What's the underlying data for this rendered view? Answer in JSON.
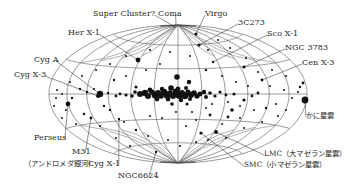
{
  "figure": {
    "type": "all-sky map (Aitoff projection, galactic coordinates)",
    "colors": {
      "grid": "#555555",
      "source": "#111111",
      "text": "#222222",
      "background": "#ffffff"
    }
  },
  "labels": [
    {
      "id": "super-cluster",
      "text": "Super Cluster?",
      "x": 93,
      "y": 10,
      "tx": 175,
      "ty": 27
    },
    {
      "id": "coma",
      "text": "Coma",
      "x": 158,
      "y": 10,
      "tx": 176,
      "ty": 25
    },
    {
      "id": "virgo",
      "text": "Virgo",
      "x": 205,
      "y": 10,
      "tx": 196,
      "ty": 34
    },
    {
      "id": "3c273",
      "text": "3C273",
      "x": 238,
      "y": 19,
      "tx": 199,
      "ty": 45
    },
    {
      "id": "her-x1",
      "text": "Her X-1",
      "x": 68,
      "y": 29,
      "tx": 138,
      "ty": 60
    },
    {
      "id": "sco-x1",
      "text": "Sco X-1",
      "x": 267,
      "y": 30,
      "tx": 213,
      "ty": 62
    },
    {
      "id": "ngc3783",
      "text": "NGC 3783",
      "x": 285,
      "y": 44,
      "tx": 244,
      "ty": 67
    },
    {
      "id": "cyg-a",
      "text": "Cyg A",
      "x": 34,
      "y": 56,
      "tx": 100,
      "ty": 94
    },
    {
      "id": "cen-x3",
      "text": "Cen X-3",
      "x": 302,
      "y": 59,
      "tx": 262,
      "ty": 80
    },
    {
      "id": "cyg-x3",
      "text": "Cyg X-3",
      "x": 14,
      "y": 71,
      "tx": 98,
      "ty": 96
    },
    {
      "id": "crab",
      "text": "かに星雲",
      "x": 306,
      "y": 112,
      "tx": 305,
      "ty": 100,
      "jp": true
    },
    {
      "id": "perseus",
      "text": "Perseus",
      "x": 34,
      "y": 134,
      "tx": 68,
      "ty": 104
    },
    {
      "id": "m31",
      "text": "M31",
      "x": 72,
      "y": 148,
      "tx": 91,
      "ty": 118
    },
    {
      "id": "lmc",
      "text": "LMC（大マゼラン星雲）",
      "x": 264,
      "y": 150,
      "tx": 216,
      "ty": 132,
      "jp": true
    },
    {
      "id": "andromeda",
      "text": "（アンドロメダ銀河）",
      "x": 24,
      "y": 160,
      "jp": true
    },
    {
      "id": "cyg-x1",
      "text": "Cyg X-1",
      "x": 88,
      "y": 160,
      "tx": 119,
      "ty": 119
    },
    {
      "id": "smc",
      "text": "SMC（小マゼラン星雲）",
      "x": 244,
      "y": 161,
      "tx": 201,
      "ty": 133,
      "jp": true
    },
    {
      "id": "ngc6624",
      "text": "NGC6624",
      "x": 118,
      "y": 172,
      "tx": 156,
      "ty": 152
    }
  ],
  "projection": {
    "cx": 178,
    "cy": 94,
    "a": 129,
    "b": 69,
    "meridian_step_deg": 30,
    "parallel_step_deg": 30
  },
  "sources": [
    [
      140,
      94,
      3
    ],
    [
      145,
      93,
      3.2
    ],
    [
      148,
      96,
      3
    ],
    [
      152,
      92,
      2.6
    ],
    [
      155,
      95,
      3.4
    ],
    [
      158,
      93,
      3
    ],
    [
      161,
      96,
      2.8
    ],
    [
      164,
      92,
      3.2
    ],
    [
      167,
      95,
      3.6
    ],
    [
      170,
      93,
      2.8
    ],
    [
      173,
      96,
      3
    ],
    [
      176,
      92,
      3.4
    ],
    [
      179,
      95,
      3.8
    ],
    [
      182,
      93,
      3
    ],
    [
      185,
      96,
      3.2
    ],
    [
      188,
      92,
      2.6
    ],
    [
      191,
      95,
      3
    ],
    [
      194,
      93,
      2.8
    ],
    [
      197,
      96,
      2.6
    ],
    [
      200,
      94,
      2.4
    ],
    [
      204,
      92,
      2.2
    ],
    [
      150,
      90,
      2.4
    ],
    [
      162,
      89,
      2.2
    ],
    [
      171,
      88,
      2.8
    ],
    [
      178,
      89,
      2.4
    ],
    [
      186,
      88,
      2
    ],
    [
      157,
      99,
      2.4
    ],
    [
      168,
      99,
      2.4
    ],
    [
      181,
      100,
      2.2
    ],
    [
      190,
      99,
      2
    ],
    [
      206,
      97,
      2
    ],
    [
      210,
      93,
      1.8
    ],
    [
      132,
      96,
      1.8
    ],
    [
      135,
      92,
      1.8
    ],
    [
      126,
      95,
      1.6
    ],
    [
      215,
      96,
      1.6
    ],
    [
      220,
      92,
      1.6
    ],
    [
      226,
      95,
      1.4
    ],
    [
      234,
      94,
      1.6
    ],
    [
      120,
      94,
      1.4
    ],
    [
      116,
      96,
      1.4
    ],
    [
      108,
      93,
      1.2
    ],
    [
      100,
      94,
      3.2
    ],
    [
      98,
      96,
      2
    ],
    [
      177,
      77,
      2.8
    ],
    [
      189,
      82,
      2.2
    ],
    [
      136,
      87,
      1.6
    ],
    [
      172,
      104,
      1.8
    ],
    [
      187,
      104,
      1.6
    ],
    [
      244,
      100,
      1.6
    ],
    [
      252,
      96,
      1.4
    ],
    [
      258,
      93,
      1.4
    ],
    [
      305,
      100,
      3.4
    ],
    [
      300,
      87,
      1.2
    ],
    [
      303,
      83,
      1.4
    ],
    [
      138,
      60,
      2.4
    ],
    [
      199,
      45,
      1.6
    ],
    [
      196,
      34,
      1.6
    ],
    [
      213,
      62,
      1.2
    ],
    [
      244,
      67,
      1.6
    ],
    [
      262,
      80,
      1.4
    ],
    [
      68,
      104,
      2.4
    ],
    [
      91,
      118,
      1.4
    ],
    [
      119,
      119,
      1.2
    ],
    [
      156,
      152,
      1.2
    ],
    [
      216,
      132,
      2
    ],
    [
      201,
      133,
      1.6
    ],
    [
      232,
      110,
      1.8
    ],
    [
      228,
      117,
      1.4
    ],
    [
      210,
      115,
      1.4
    ],
    [
      72,
      98,
      1.2
    ],
    [
      80,
      89,
      1.2
    ],
    [
      87,
      92,
      1.2
    ],
    [
      94,
      89,
      1
    ],
    [
      62,
      94,
      1
    ],
    [
      57,
      90,
      1
    ],
    [
      56,
      98,
      1
    ],
    [
      66,
      110,
      1
    ],
    [
      84,
      114,
      1.2
    ],
    [
      104,
      106,
      1.2
    ],
    [
      110,
      110,
      1.2
    ],
    [
      124,
      122,
      1
    ],
    [
      136,
      130,
      1.2
    ],
    [
      148,
      136,
      1
    ],
    [
      168,
      140,
      1
    ],
    [
      186,
      126,
      1
    ],
    [
      196,
      120,
      1
    ],
    [
      206,
      108,
      1
    ],
    [
      222,
      124,
      1
    ],
    [
      240,
      118,
      1
    ],
    [
      254,
      110,
      1
    ],
    [
      266,
      108,
      1.2
    ],
    [
      276,
      104,
      1
    ],
    [
      286,
      110,
      1
    ],
    [
      292,
      98,
      1
    ],
    [
      284,
      90,
      1
    ],
    [
      270,
      86,
      1
    ],
    [
      258,
      72,
      1
    ],
    [
      246,
      58,
      1
    ],
    [
      230,
      48,
      1
    ],
    [
      218,
      40,
      1
    ],
    [
      208,
      50,
      1
    ],
    [
      190,
      56,
      1
    ],
    [
      170,
      52,
      1
    ],
    [
      150,
      50,
      1
    ],
    [
      126,
      56,
      1
    ],
    [
      110,
      64,
      1
    ],
    [
      96,
      70,
      1
    ],
    [
      82,
      76,
      1
    ],
    [
      70,
      82,
      1
    ],
    [
      114,
      80,
      1.2
    ],
    [
      126,
      76,
      1
    ],
    [
      146,
      70,
      1
    ],
    [
      160,
      64,
      1
    ],
    [
      206,
      70,
      1.2
    ],
    [
      222,
      76,
      1
    ],
    [
      236,
      82,
      1
    ],
    [
      248,
      86,
      1
    ],
    [
      272,
      70,
      1
    ],
    [
      286,
      76,
      1
    ],
    [
      298,
      92,
      1
    ],
    [
      150,
      116,
      1
    ],
    [
      162,
      118,
      1
    ],
    [
      176,
      112,
      1
    ],
    [
      192,
      112,
      1
    ],
    [
      212,
      104,
      1
    ],
    [
      228,
      102,
      1
    ],
    [
      240,
      106,
      1
    ],
    [
      100,
      126,
      1
    ],
    [
      116,
      138,
      1
    ],
    [
      130,
      146,
      1
    ],
    [
      180,
      146,
      1
    ],
    [
      196,
      142,
      1
    ],
    [
      208,
      140,
      1
    ],
    [
      226,
      138,
      1
    ],
    [
      244,
      128,
      1
    ],
    [
      262,
      122,
      1
    ],
    [
      278,
      116,
      1
    ],
    [
      76,
      124,
      1
    ],
    [
      62,
      118,
      1
    ],
    [
      54,
      106,
      1
    ]
  ]
}
